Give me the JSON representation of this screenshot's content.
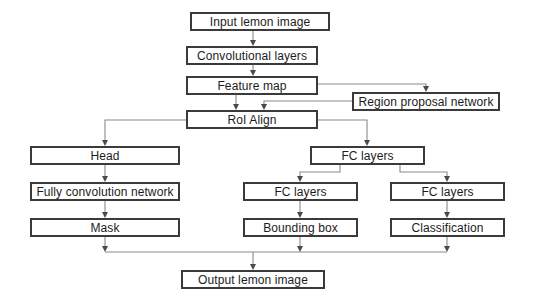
{
  "diagram": {
    "type": "flowchart",
    "background_color": "#ffffff",
    "box_border_color": "#3a3a3a",
    "connector_color": "#8a8a8a",
    "text_color": "#1c1c1c",
    "nodes": [
      {
        "id": "input",
        "label": "Input lemon image",
        "x": 190,
        "y": 12,
        "w": 140,
        "h": 19
      },
      {
        "id": "conv",
        "label": "Convolutional layers",
        "x": 186,
        "y": 46,
        "w": 132,
        "h": 19
      },
      {
        "id": "feature",
        "label": "Feature map",
        "x": 186,
        "y": 76,
        "w": 132,
        "h": 19
      },
      {
        "id": "rpn",
        "label": "Region proposal network",
        "x": 352,
        "y": 92,
        "w": 148,
        "h": 19
      },
      {
        "id": "roialign",
        "label": "RoI Align",
        "x": 186,
        "y": 110,
        "w": 132,
        "h": 19
      },
      {
        "id": "head",
        "label": "Head",
        "x": 30,
        "y": 146,
        "w": 150,
        "h": 19
      },
      {
        "id": "fc_top",
        "label": "FC layers",
        "x": 310,
        "y": 146,
        "w": 115,
        "h": 19
      },
      {
        "id": "fcn",
        "label": "Fully convolution network",
        "x": 30,
        "y": 182,
        "w": 150,
        "h": 19
      },
      {
        "id": "fc_mid",
        "label": "FC layers",
        "x": 243,
        "y": 182,
        "w": 115,
        "h": 19
      },
      {
        "id": "fc_right",
        "label": "FC layers",
        "x": 390,
        "y": 182,
        "w": 115,
        "h": 19
      },
      {
        "id": "mask",
        "label": "Mask",
        "x": 30,
        "y": 218,
        "w": 150,
        "h": 19
      },
      {
        "id": "bbox",
        "label": "Bounding box",
        "x": 243,
        "y": 218,
        "w": 115,
        "h": 19
      },
      {
        "id": "classify",
        "label": "Classification",
        "x": 390,
        "y": 218,
        "w": 115,
        "h": 19
      },
      {
        "id": "output",
        "label": "Output lemon image",
        "x": 181,
        "y": 270,
        "w": 144,
        "h": 19
      }
    ],
    "edges": [
      {
        "from": "input",
        "to": "conv",
        "style": "straight-down"
      },
      {
        "from": "conv",
        "to": "feature",
        "style": "straight-down"
      },
      {
        "from": "feature",
        "to": "rpn",
        "style": "right-then-down"
      },
      {
        "from": "rpn",
        "to": "roialign",
        "style": "left-then-down"
      },
      {
        "from": "feature",
        "to": "roialign",
        "style": "straight-down"
      },
      {
        "from": "roialign",
        "to": "head",
        "style": "left-then-down"
      },
      {
        "from": "roialign",
        "to": "fc_top",
        "style": "right-then-down"
      },
      {
        "from": "head",
        "to": "fcn",
        "style": "straight-down"
      },
      {
        "from": "fcn",
        "to": "mask",
        "style": "straight-down"
      },
      {
        "from": "fc_top",
        "to": "fc_mid",
        "style": "left-then-down"
      },
      {
        "from": "fc_top",
        "to": "fc_right",
        "style": "right-then-down"
      },
      {
        "from": "fc_mid",
        "to": "bbox",
        "style": "straight-down"
      },
      {
        "from": "fc_right",
        "to": "classify",
        "style": "straight-down"
      },
      {
        "from": "mask",
        "to": "output",
        "style": "bus-merge-down"
      },
      {
        "from": "bbox",
        "to": "output",
        "style": "bus-merge-down"
      },
      {
        "from": "classify",
        "to": "output",
        "style": "bus-merge-down"
      }
    ]
  }
}
